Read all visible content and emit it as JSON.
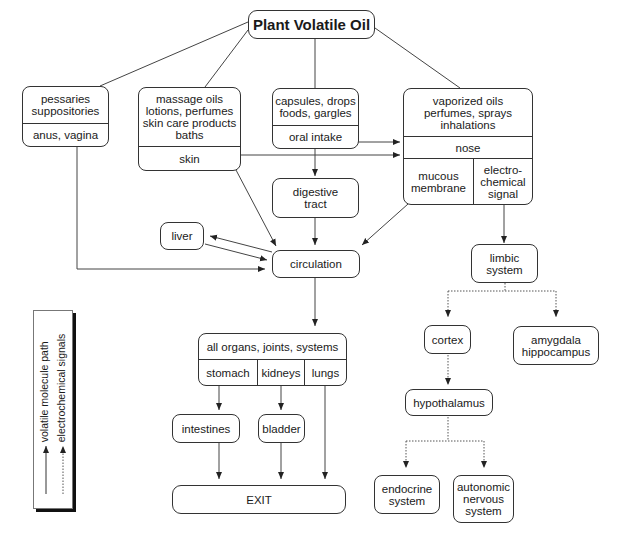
{
  "diagram": {
    "title": "Plant Volatile Oil",
    "nodes": {
      "rectal": {
        "products": [
          "pessaries",
          "suppositories"
        ],
        "route": "anus, vagina"
      },
      "topical": {
        "products": [
          "massage oils",
          "lotions, perfumes",
          "skin care products",
          "baths"
        ],
        "route": "skin"
      },
      "oral": {
        "products": [
          "capsules, drops",
          "foods, gargles"
        ],
        "route": "oral intake"
      },
      "inhaled": {
        "products": [
          "vaporized oils",
          "perfumes, sprays",
          "inhalations"
        ],
        "route": "nose",
        "sub_left": [
          "mucous",
          "membrane"
        ],
        "sub_right": [
          "electro-",
          "chemical",
          "signal"
        ]
      },
      "digestive": [
        "digestive",
        "tract"
      ],
      "liver": "liver",
      "circulation": "circulation",
      "organs": {
        "header": "all organs, joints, systems",
        "cols": [
          "stomach",
          "kidneys",
          "lungs"
        ]
      },
      "intestines": "intestines",
      "bladder": "bladder",
      "exit": "EXIT",
      "limbic": [
        "limbic",
        "system"
      ],
      "cortex": "cortex",
      "amygdala": [
        "amygdala",
        "hippocampus"
      ],
      "hypothalamus": "hypothalamus",
      "endocrine": [
        "endocrine",
        "system"
      ],
      "autonomic": [
        "autonomic",
        "nervous",
        "system"
      ]
    },
    "legend": {
      "solid": "volatile molecule path",
      "dotted": "electrochemical signals"
    },
    "colors": {
      "line": "#333333",
      "background": "#ffffff"
    }
  }
}
